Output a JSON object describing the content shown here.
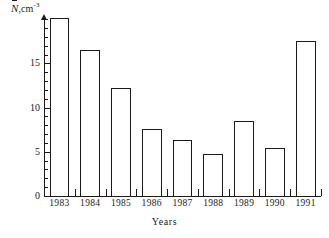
{
  "chart_data": {
    "type": "bar",
    "title": "",
    "subtitle": "",
    "ylabel": "N̅,cm⁻³",
    "ylabel_parts": {
      "symbol": "N",
      "accent": "bar",
      "unit": "cm",
      "exponent": "-3"
    },
    "xlabel": "Years",
    "categories": [
      "1983",
      "1984",
      "1985",
      "1986",
      "1987",
      "1988",
      "1989",
      "1990",
      "1991"
    ],
    "values": [
      20.1,
      16.5,
      12.2,
      7.6,
      6.3,
      4.8,
      8.5,
      5.4,
      17.5
    ],
    "ylim": [
      0,
      20.5
    ],
    "xlim": [
      0,
      9
    ],
    "y_major_ticks": [
      0,
      5,
      10,
      15
    ],
    "y_major_tick_labels": [
      "0",
      "5",
      "10",
      "15"
    ],
    "y_minor_tick_step": 1,
    "grid": false,
    "legend": null,
    "bar_fill": "#ffffff",
    "bar_edge": "#1a1a1a",
    "axis_color": "#1a1a1a",
    "background": "#ffffff",
    "annotations": []
  }
}
